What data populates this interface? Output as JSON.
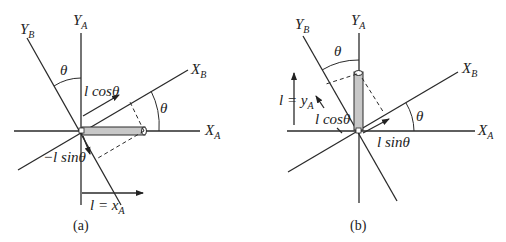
{
  "figure": {
    "panel_a": {
      "caption": "(a)",
      "axes": {
        "xa": "X",
        "xa_sub": "A",
        "ya": "Y",
        "ya_sub": "A",
        "xb": "X",
        "xb_sub": "B",
        "yb": "Y",
        "yb_sub": "B"
      },
      "angle_labels": [
        "θ",
        "θ"
      ],
      "component_labels": {
        "cos": "l cosθ",
        "sin": "−l sinθ",
        "length": "l = x",
        "length_sub": "A"
      }
    },
    "panel_b": {
      "caption": "(b)",
      "axes": {
        "xa": "X",
        "xa_sub": "A",
        "ya": "Y",
        "ya_sub": "A",
        "xb": "X",
        "xb_sub": "B",
        "yb": "Y",
        "yb_sub": "B"
      },
      "angle_labels": [
        "θ",
        "θ"
      ],
      "component_labels": {
        "cos": "l cosθ",
        "sin": "l sinθ",
        "length": "l = y",
        "length_sub": "A"
      }
    },
    "colors": {
      "line": "#2a2a2a",
      "bar_fill": "#c8c8c8"
    }
  }
}
